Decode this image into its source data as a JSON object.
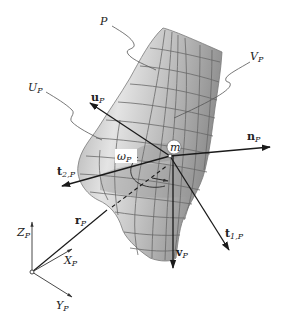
{
  "figure": {
    "surface_label": "P",
    "u_curve_label": {
      "main": "U",
      "sub": "P"
    },
    "v_curve_label": {
      "main": "V",
      "sub": "P"
    },
    "point_label": "m",
    "angle_label": {
      "main": "ω",
      "sub": "P"
    },
    "vectors": {
      "u": {
        "main": "u",
        "sub": "P"
      },
      "n": {
        "main": "n",
        "sub": "P"
      },
      "t2": {
        "main": "t",
        "sub": "2,P"
      },
      "t1": {
        "main": "t",
        "sub": "1,P"
      },
      "v": {
        "main": "v",
        "sub": "P"
      },
      "r": {
        "main": "r",
        "sub": "P"
      }
    },
    "axes": {
      "z": {
        "main": "Z",
        "sub": "P"
      },
      "x": {
        "main": "X",
        "sub": "P"
      },
      "y": {
        "main": "Y",
        "sub": "P"
      }
    },
    "colors": {
      "surface_light": "#e8e8e8",
      "surface_mid": "#b4b4b4",
      "surface_dark": "#8a8a8a",
      "grid": "#6a6a6a",
      "vector": "#1a1a1a"
    }
  }
}
